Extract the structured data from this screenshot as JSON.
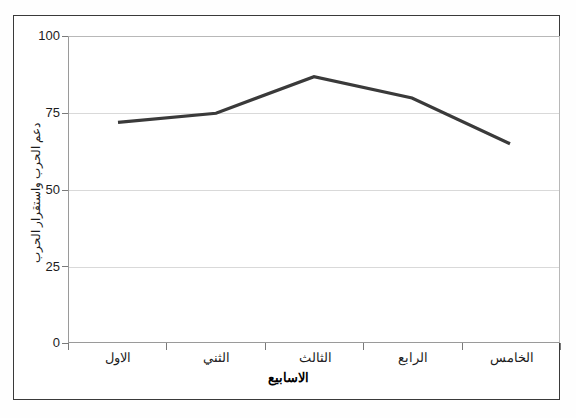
{
  "chart_data": {
    "type": "line",
    "title": "",
    "categories": [
      "الاول",
      "الثني",
      "الثالث",
      "الرابع",
      "الخامس"
    ],
    "values": [
      72,
      75,
      87,
      80,
      65
    ],
    "series": [
      {
        "name": "دعم الحرب واستقرار الحرب",
        "values": [
          72,
          75,
          87,
          80,
          65
        ]
      }
    ],
    "xlabel": "الاسابيع",
    "ylabel": "دعم الحرب واستقرار الحرب",
    "ylim": [
      0,
      100
    ],
    "yticks": [
      "0",
      "25",
      "50",
      "75",
      "100"
    ],
    "ytick_values": [
      0,
      25,
      50,
      75,
      100
    ],
    "grid": true,
    "legend": false,
    "line_color": "#3a3a3a",
    "frame_color": "#3a3a3a",
    "gridline_color": "#d9d9d9",
    "background_color": "#ffffff"
  },
  "axes": {
    "y_label": "دعم الحرب واستقرار الحرب",
    "x_label": "الاسابيع",
    "y_ticks": [
      {
        "label": "100",
        "value": 100
      },
      {
        "label": "75",
        "value": 75
      },
      {
        "label": "50",
        "value": 50
      },
      {
        "label": "25",
        "value": 25
      },
      {
        "label": "0",
        "value": 0
      }
    ],
    "x_ticks": [
      {
        "label": "الاول",
        "index": 0
      },
      {
        "label": "الثني",
        "index": 1
      },
      {
        "label": "الثالث",
        "index": 2
      },
      {
        "label": "الرابع",
        "index": 3
      },
      {
        "label": "الخامس",
        "index": 4
      }
    ]
  }
}
